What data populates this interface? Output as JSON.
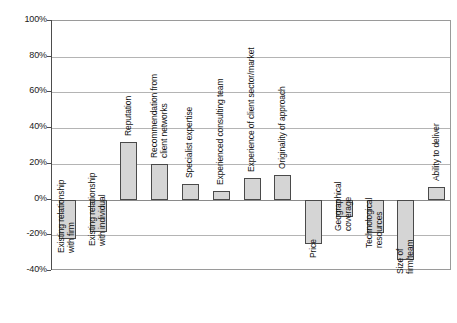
{
  "chart_data": {
    "type": "bar",
    "title": "",
    "subtitle": "",
    "xlabel": "",
    "ylabel": "",
    "ylim": [
      -40,
      100
    ],
    "ytick_values": [
      100,
      80,
      60,
      40,
      20,
      0,
      -20,
      -40
    ],
    "ytick_labels": [
      "100%",
      "80%",
      "60%",
      "40%",
      "20%",
      "0%",
      "-20%",
      "-40%"
    ],
    "grid": true,
    "legend": false,
    "orientation": "vertical",
    "value_unit": "%",
    "bar_fill_color": "#d5d5d5",
    "bar_edge_color": "#4a4a4a",
    "gridline_color": "#b4b4b4",
    "axis_color": "#4d4d4d",
    "categories": [
      "Existing relationship with firm",
      "Existing relationship with individual",
      "Reputation",
      "Recommendation from client networks",
      "Specialist expertise",
      "Experienced consulting team",
      "Experience of client sector/market",
      "Originality of approach",
      "Price",
      "Geographical coverage",
      "Technological resources",
      "Size of firm/team",
      "Ability to deliver"
    ],
    "values": [
      -22,
      -18,
      32,
      20,
      9,
      5,
      12,
      14,
      -25,
      -10,
      -19,
      -34,
      7
    ],
    "labels_rotated": true,
    "label_rotation_deg": -90,
    "bars": [
      {
        "category": "Existing relationship with firm",
        "label_line_1": "Existing relationship",
        "label_line_2": "with firm",
        "value": -22
      },
      {
        "category": "Existing relationship with individual",
        "label_line_1": "Existing relationship",
        "label_line_2": "with individual",
        "value": -18
      },
      {
        "category": "Reputation",
        "label_line_1": "Reputation",
        "label_line_2": "",
        "value": 32
      },
      {
        "category": "Recommendation from client networks",
        "label_line_1": "Recommendation from",
        "label_line_2": "client networks",
        "value": 20
      },
      {
        "category": "Specialist expertise",
        "label_line_1": "Specialist expertise",
        "label_line_2": "",
        "value": 9
      },
      {
        "category": "Experienced consulting team",
        "label_line_1": "Experienced consulting team",
        "label_line_2": "",
        "value": 5
      },
      {
        "category": "Experience of client sector/market",
        "label_line_1": "Experience of client sector/market",
        "label_line_2": "",
        "value": 12
      },
      {
        "category": "Originality of approach",
        "label_line_1": "Originality of approach",
        "label_line_2": "",
        "value": 14
      },
      {
        "category": "Price",
        "label_line_1": "Price",
        "label_line_2": "",
        "value": -25
      },
      {
        "category": "Geographical coverage",
        "label_line_1": "Geographical",
        "label_line_2": "coverage",
        "value": -10
      },
      {
        "category": "Technological resources",
        "label_line_1": "Technological",
        "label_line_2": "resources",
        "value": -19
      },
      {
        "category": "Size of firm/team",
        "label_line_1": "Size of",
        "label_line_2": "firm/team",
        "value": -34
      },
      {
        "category": "Ability to deliver",
        "label_line_1": "Ability to deliver",
        "label_line_2": "",
        "value": 7
      }
    ]
  }
}
